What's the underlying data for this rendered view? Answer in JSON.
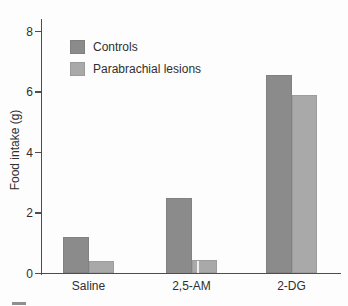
{
  "chart_data": {
    "type": "bar",
    "title": "",
    "xlabel": "",
    "ylabel": "Food intake (g)",
    "ylim": [
      0,
      8
    ],
    "yticks": [
      0,
      2,
      4,
      6,
      8
    ],
    "grid": false,
    "legend_position": "upper-left-inside",
    "categories": [
      "Saline",
      "2,5-AM",
      "2-DG"
    ],
    "series": [
      {
        "name": "Controls",
        "color": "#8b8b8b",
        "values": [
          1.2,
          2.5,
          6.55
        ]
      },
      {
        "name": "Parabrachial lesions",
        "color": "#a9a9a9",
        "values": [
          0.4,
          0.45,
          5.9
        ]
      }
    ]
  }
}
